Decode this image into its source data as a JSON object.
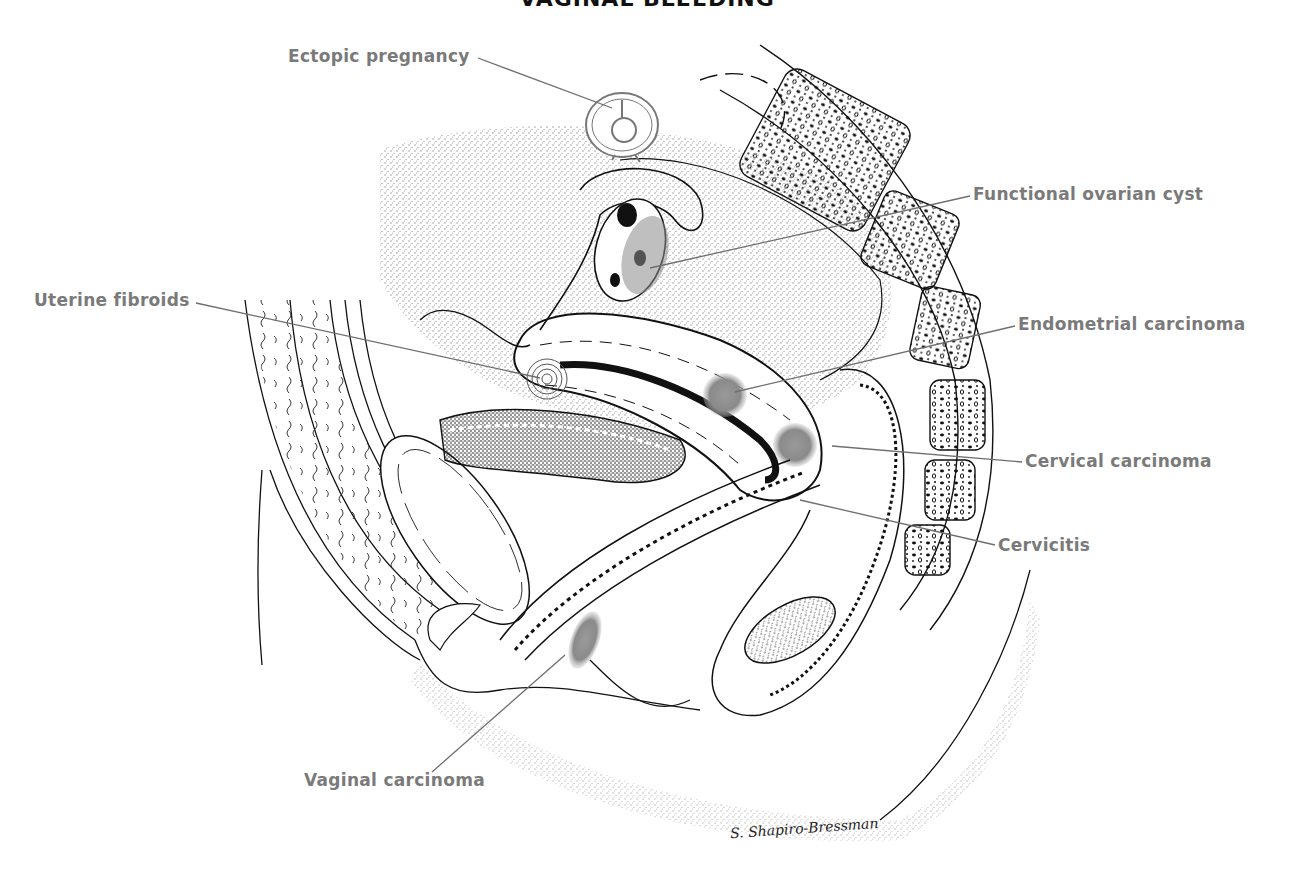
{
  "title": "VAGINAL BLEEDING",
  "labels": {
    "ectopic_pregnancy": "Ectopic pregnancy",
    "functional_ovarian_cyst": "Functional ovarian cyst",
    "uterine_fibroids": "Uterine fibroids",
    "endometrial_carcinoma": "Endometrial carcinoma",
    "cervical_carcinoma": "Cervical carcinoma",
    "cervicitis": "Cervicitis",
    "vaginal_carcinoma": "Vaginal carcinoma"
  },
  "signature": "S. Shapiro-Bressman",
  "colors": {
    "label_text": "#7a7a7a",
    "leader_line": "#6e6e6e",
    "ink": "#111111",
    "lesion_gray": "#8a8a8a"
  }
}
